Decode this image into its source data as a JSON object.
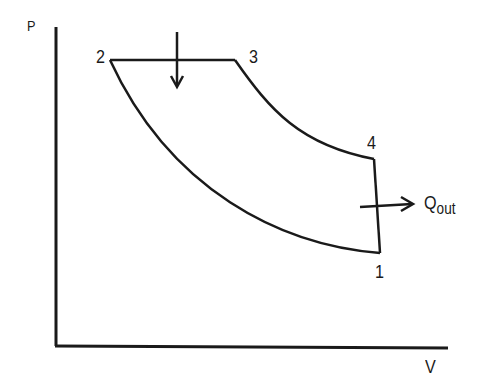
{
  "diagram": {
    "type": "P-V diagram (Diesel cycle)",
    "axes": {
      "y_label": "P",
      "x_label": "V"
    },
    "points": [
      {
        "id": "1",
        "label": "1",
        "x": 380,
        "y": 253
      },
      {
        "id": "2",
        "label": "2",
        "x": 110,
        "y": 60
      },
      {
        "id": "3",
        "label": "3",
        "x": 235,
        "y": 60
      },
      {
        "id": "4",
        "label": "4",
        "x": 374,
        "y": 159
      }
    ],
    "heat_out": {
      "main": "Q",
      "sub": "out"
    },
    "colors": {
      "line": "#1a1a1a",
      "background": "#ffffff"
    }
  }
}
